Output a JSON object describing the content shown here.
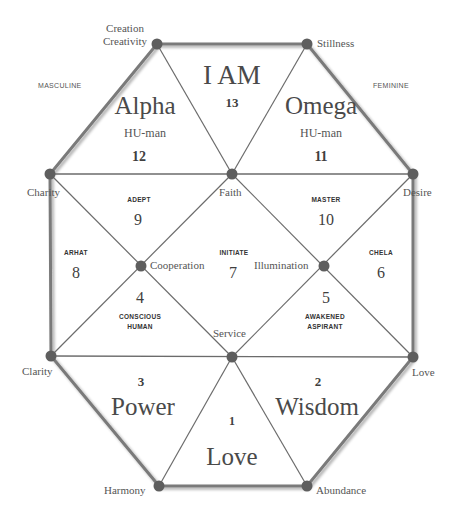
{
  "diagram": {
    "colors": {
      "line": "#6b6b6b",
      "node": "#5e5e5e",
      "text": "#555555",
      "background": "#ffffff"
    },
    "side_labels": {
      "left": "MASCULINE",
      "right": "FEMININE"
    },
    "vertices": {
      "top_left": {
        "line1": "Creation",
        "line2": "Creativity"
      },
      "top_right": "Stillness",
      "left": "Charity",
      "right": "Desire",
      "center_top": "Faith",
      "center_left": "Cooperation",
      "center_right": "Illumination",
      "center_bottom": "Service",
      "bottom_left_side": "Clarity",
      "bottom_right_side": "Love",
      "bottom_left": "Harmony",
      "bottom_right": "Abundance"
    },
    "regions": [
      {
        "number": "1",
        "name": "Love"
      },
      {
        "number": "2",
        "name": "Wisdom"
      },
      {
        "number": "3",
        "name": "Power"
      },
      {
        "number": "4",
        "stage": "CONSCIOUS",
        "stage2": "HUMAN"
      },
      {
        "number": "5",
        "stage": "AWAKENED",
        "stage2": "ASPIRANT"
      },
      {
        "number": "6",
        "stage": "CHELA"
      },
      {
        "number": "7",
        "stage": "INITIATE"
      },
      {
        "number": "8",
        "stage": "ARHAT"
      },
      {
        "number": "9",
        "stage": "ADEPT"
      },
      {
        "number": "10",
        "stage": "MASTER"
      },
      {
        "number": "11",
        "name": "Omega",
        "sub": "HU-man"
      },
      {
        "number": "12",
        "name": "Alpha",
        "sub": "HU-man"
      },
      {
        "number": "13",
        "name": "I AM"
      }
    ]
  }
}
